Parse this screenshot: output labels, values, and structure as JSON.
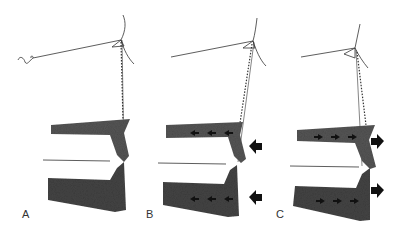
{
  "figure": {
    "panels": [
      {
        "label": "A",
        "arrows": "none"
      },
      {
        "label": "B",
        "arrows": "inward (pointing left)"
      },
      {
        "label": "C",
        "arrows": "outward (pointing right)"
      }
    ],
    "colors": {
      "fill": "#4a4a4a",
      "line": "#333333",
      "background": "#ffffff"
    }
  }
}
